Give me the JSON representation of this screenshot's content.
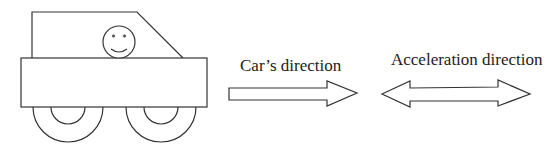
{
  "diagram": {
    "labels": {
      "car_direction": "Car’s direction",
      "acceleration_direction": "Acceleration direction"
    },
    "elements": {
      "car": {
        "parts": [
          "cabin",
          "body",
          "driver-face",
          "front-wheel",
          "rear-wheel"
        ]
      },
      "car_direction_arrow": {
        "type": "single-headed arrow",
        "points": "right"
      },
      "acceleration_arrow": {
        "type": "double-headed arrow",
        "points": "left-and-right"
      }
    },
    "colors": {
      "stroke": "#333333",
      "background": "#ffffff"
    }
  }
}
